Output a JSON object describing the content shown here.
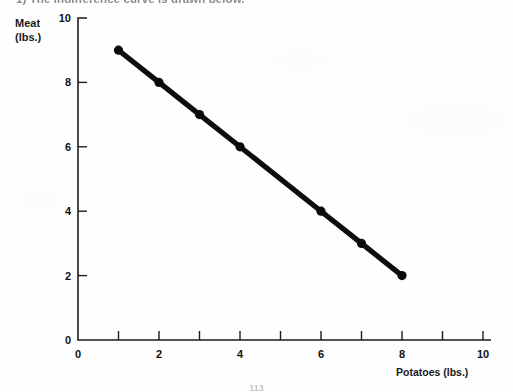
{
  "header": {
    "text": "1)  The indifference curve is drawn below."
  },
  "footer": {
    "page_number": "113"
  },
  "axes": {
    "y_title_line1": "Meat",
    "y_title_line2": "(lbs.)",
    "x_title": "Potatoes (lbs.)"
  },
  "chart_data": {
    "type": "line",
    "title": "",
    "subtitle": "",
    "xlabel": "Potatoes (lbs.)",
    "ylabel": "Meat (lbs.)",
    "xlim": [
      0,
      10
    ],
    "ylim": [
      0,
      10
    ],
    "grid": false,
    "legend": null,
    "x_ticks": [
      0,
      1,
      2,
      3,
      4,
      5,
      6,
      7,
      8,
      9,
      10
    ],
    "x_tick_labels": [
      "0",
      "",
      "2",
      "",
      "4",
      "",
      "6",
      "",
      "8",
      "",
      "10"
    ],
    "y_ticks": [
      0,
      2,
      4,
      6,
      8,
      10
    ],
    "y_tick_labels": [
      "0",
      "2",
      "4",
      "6",
      "8",
      "10"
    ],
    "series": [
      {
        "name": "Indifference curve",
        "marker": "circle",
        "color": "#0a0a0a",
        "x": [
          1,
          2,
          3,
          4,
          6,
          7,
          8
        ],
        "y": [
          9,
          8,
          7,
          6,
          4,
          3,
          2
        ],
        "points": [
          {
            "x": 1,
            "y": 9
          },
          {
            "x": 2,
            "y": 8
          },
          {
            "x": 3,
            "y": 7
          },
          {
            "x": 4,
            "y": 6
          },
          {
            "x": 6,
            "y": 4
          },
          {
            "x": 7,
            "y": 3
          },
          {
            "x": 8,
            "y": 2
          }
        ]
      }
    ]
  }
}
